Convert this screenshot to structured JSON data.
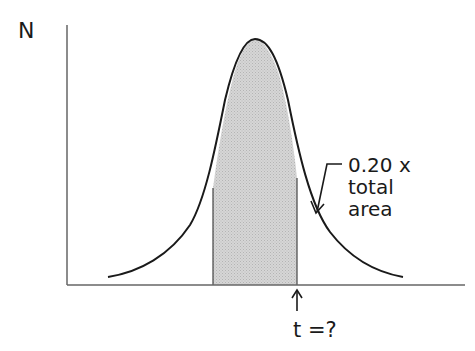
{
  "diagram": {
    "type": "normal-distribution",
    "y_axis_label": "N",
    "annotation": {
      "line1": "0.20 x",
      "line2": "total",
      "line3": "area"
    },
    "marker_label": "t =?",
    "shaded_fraction": 0.2,
    "colors": {
      "curve": "#1a1a1a",
      "axis": "#555555",
      "shade": "#cfcfcf",
      "background": "#ffffff"
    }
  }
}
